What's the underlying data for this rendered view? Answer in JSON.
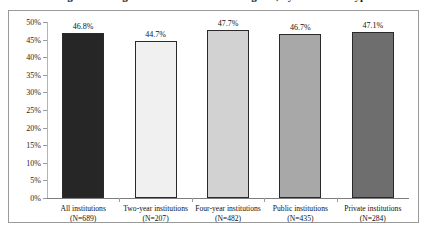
{
  "title": {
    "text": "Percentage of Undergraduate Students Receiving Aid, by Institution Type",
    "visibility": "cropped at top edge"
  },
  "chart_data": {
    "type": "bar",
    "title": "",
    "xlabel": "",
    "ylabel": "",
    "ylim": [
      0,
      50
    ],
    "grid": false,
    "legend": "none",
    "categories": [
      "All institutions (N=689)",
      "Two-year institutions (N=207)",
      "Four-year institutions (N=482)",
      "Public institutions (N=435)",
      "Private institutions (N=284)"
    ],
    "values": [
      46.8,
      44.7,
      47.7,
      46.7,
      47.1
    ],
    "data_labels": [
      "46.8%",
      "44.7%",
      "47.7%",
      "46.7%",
      "47.1%"
    ],
    "ytick_labels": [
      "50%",
      "45%",
      "40%",
      "35%",
      "30%",
      "25%",
      "20%",
      "15%",
      "10%",
      "5%",
      "0%"
    ],
    "ytick_values": [
      50,
      45,
      40,
      35,
      30,
      25,
      20,
      15,
      10,
      5,
      0
    ],
    "bar_colors": [
      "#262626",
      "#f0f0f0",
      "#d2d2d2",
      "#a8a8a8",
      "#6e6e6e"
    ],
    "bar_outline_color": "#2a2a2a"
  },
  "categories_lines": [
    {
      "line1": "All institutions (N=689)",
      "line2": ""
    },
    {
      "line1": "Two-year institutions",
      "line2": "(N=207)"
    },
    {
      "line1": "Four-year institutions",
      "line2": "(N=482)"
    },
    {
      "line1": "Public institutions",
      "line2": "(N=435)"
    },
    {
      "line1": "Private institutions",
      "line2": "(N=284)"
    }
  ],
  "frame": {
    "border_color": "#9a9a9a",
    "background": "#ffffff"
  }
}
